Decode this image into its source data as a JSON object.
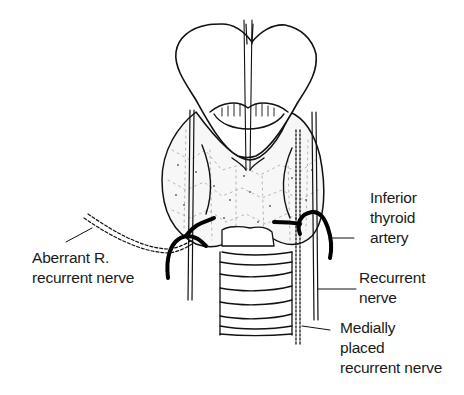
{
  "diagram": {
    "type": "anatomical illustration",
    "colors": {
      "line": "#111111",
      "background": "#ffffff",
      "text": "#1a1a1a"
    }
  },
  "labels": {
    "inferior_thyroid_artery": {
      "line1": "Inferior",
      "line2": "thyroid",
      "line3": "artery"
    },
    "recurrent_nerve": {
      "line1": "Recurrent",
      "line2": "nerve"
    },
    "medially_placed": {
      "line1": "Medially",
      "line2": "placed",
      "line3": "recurrent nerve"
    },
    "aberrant": {
      "line1": "Aberrant R.",
      "line2": "recurrent nerve"
    }
  }
}
